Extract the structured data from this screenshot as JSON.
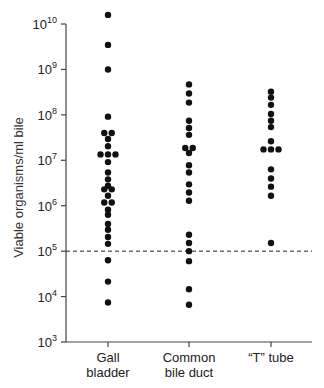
{
  "chart_data": {
    "type": "scatter",
    "subtype": "dot-strip (column scatter), log scale",
    "title": "",
    "xlabel": "",
    "ylabel": "Viable organisms/ml bile",
    "yscale": "log",
    "ylim": [
      1000,
      10000000000
    ],
    "ytick_labels": [
      "10^3",
      "10^4",
      "10^5",
      "10^6",
      "10^7",
      "10^8",
      "10^9",
      "10^10"
    ],
    "categories": [
      "Gall bladder",
      "Common bile duct",
      "\"T\" tube"
    ],
    "reference_line": {
      "y": 100000,
      "style": "dashed"
    },
    "grid": false,
    "legend": null,
    "series": [
      {
        "name": "Gall bladder",
        "log10_values": [
          10.2,
          9.54,
          9.0,
          7.96,
          7.6,
          7.6,
          7.47,
          7.31,
          7.13,
          7.13,
          7.13,
          6.96,
          6.73,
          6.58,
          6.44,
          6.36,
          6.36,
          6.22,
          6.07,
          6.07,
          5.91,
          5.8,
          5.6,
          5.47,
          5.31,
          5.16,
          4.8,
          4.33,
          3.87
        ]
      },
      {
        "name": "Common bile duct",
        "log10_values": [
          8.67,
          8.47,
          8.27,
          7.87,
          7.71,
          7.56,
          7.27,
          7.27,
          7.16,
          6.89,
          6.73,
          6.47,
          6.29,
          6.11,
          5.36,
          5.18,
          5.0,
          4.78,
          4.16,
          3.82
        ]
      },
      {
        "name": "\"T\" tube",
        "log10_values": [
          8.51,
          8.38,
          8.22,
          8.02,
          7.87,
          7.73,
          7.42,
          7.24,
          7.24,
          7.24,
          6.8,
          6.6,
          6.42,
          6.22,
          5.18
        ]
      }
    ]
  },
  "axis": {
    "ylabel": "Viable organisms/ml bile",
    "yticks": [
      {
        "base": "10",
        "exp": "10",
        "log": 10
      },
      {
        "base": "10",
        "exp": "9",
        "log": 9
      },
      {
        "base": "10",
        "exp": "8",
        "log": 8
      },
      {
        "base": "10",
        "exp": "7",
        "log": 7
      },
      {
        "base": "10",
        "exp": "6",
        "log": 6
      },
      {
        "base": "10",
        "exp": "5",
        "log": 5
      },
      {
        "base": "10",
        "exp": "4",
        "log": 4
      },
      {
        "base": "10",
        "exp": "3",
        "log": 3
      }
    ],
    "xcats": [
      {
        "line1": "Gall",
        "line2": "bladder"
      },
      {
        "line1": "Common",
        "line2": "bile duct"
      },
      {
        "line1": "“T” tube",
        "line2": ""
      }
    ]
  },
  "style": {
    "ink": "#111111",
    "axis_color": "#444444",
    "dot_radius": 3.2
  }
}
